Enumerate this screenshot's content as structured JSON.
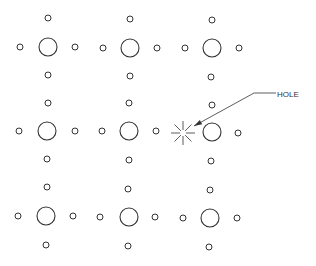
{
  "diagram": {
    "title": "",
    "colors": {
      "line": "#333333",
      "background": "#ffffff"
    },
    "grid": {
      "rows": 3,
      "cols": 3,
      "large_radius": 9,
      "small_radius": 3,
      "groups": [
        {
          "cx": 48,
          "cy": 47,
          "top": [
            48,
            18
          ],
          "left": [
            20,
            47
          ],
          "right": [
            75,
            47
          ],
          "bottom": [
            48,
            75
          ]
        },
        {
          "cx": 130,
          "cy": 48,
          "top": [
            130,
            19
          ],
          "left": [
            103,
            48
          ],
          "right": [
            157,
            48
          ],
          "bottom": [
            130,
            76
          ]
        },
        {
          "cx": 212,
          "cy": 48,
          "top": [
            212,
            20
          ],
          "left": [
            185,
            48
          ],
          "right": [
            239,
            48
          ],
          "bottom": [
            211,
            77
          ]
        },
        {
          "cx": 47,
          "cy": 131,
          "top": [
            48,
            103
          ],
          "left": [
            19,
            131
          ],
          "right": [
            75,
            131
          ],
          "bottom": [
            47,
            159
          ]
        },
        {
          "cx": 129,
          "cy": 131,
          "top": [
            129,
            103
          ],
          "left": [
            102,
            131
          ],
          "right": [
            156,
            131
          ],
          "bottom": [
            129,
            160
          ]
        },
        {
          "cx": 212,
          "cy": 132,
          "top": [
            212,
            105
          ],
          "left": null,
          "right": [
            238,
            133
          ],
          "bottom": [
            211,
            161
          ]
        },
        {
          "cx": 46,
          "cy": 216,
          "top": [
            47,
            187
          ],
          "left": [
            18,
            216
          ],
          "right": [
            73,
            216
          ],
          "bottom": [
            46,
            245
          ]
        },
        {
          "cx": 129,
          "cy": 217,
          "top": [
            128,
            189
          ],
          "left": [
            100,
            217
          ],
          "right": [
            155,
            217
          ],
          "bottom": [
            128,
            246
          ]
        },
        {
          "cx": 210,
          "cy": 218,
          "top": [
            210,
            190
          ],
          "left": [
            183,
            218
          ],
          "right": [
            237,
            218
          ],
          "bottom": [
            209,
            247
          ]
        }
      ]
    },
    "hole": {
      "cx": 183,
      "cy": 133,
      "rays": 8,
      "radius": 12
    },
    "callout": {
      "text": "HOLE",
      "arrow_tip": [
        194,
        126
      ],
      "elbow": [
        254,
        93
      ],
      "end": [
        276,
        93
      ],
      "text_pos": [
        277,
        97
      ]
    }
  }
}
